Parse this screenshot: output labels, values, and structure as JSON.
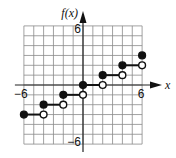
{
  "chart_data": {
    "type": "line",
    "subtype": "step-function",
    "title": "",
    "xlabel": "x",
    "ylabel": "f(x)",
    "xlim": [
      -6,
      6
    ],
    "ylim": [
      -6,
      6
    ],
    "grid": true,
    "grid_step": 1,
    "tick_labels": {
      "x_min": "−6",
      "x_max": "6",
      "y_min": "−6",
      "y_max": "6"
    },
    "segments": [
      {
        "x_start": -6,
        "x_end": -4,
        "y": -3,
        "start_closed": true,
        "end_closed": false
      },
      {
        "x_start": -4,
        "x_end": -2,
        "y": -2,
        "start_closed": true,
        "end_closed": false
      },
      {
        "x_start": -2,
        "x_end": 0,
        "y": -1,
        "start_closed": true,
        "end_closed": false
      },
      {
        "x_start": 0,
        "x_end": 2,
        "y": 0,
        "start_closed": true,
        "end_closed": false
      },
      {
        "x_start": 2,
        "x_end": 4,
        "y": 1,
        "start_closed": true,
        "end_closed": false
      },
      {
        "x_start": 4,
        "x_end": 6,
        "y": 2,
        "start_closed": true,
        "end_closed": false
      }
    ],
    "isolated_points": [
      {
        "x": 6,
        "y": 3,
        "closed": true
      }
    ]
  }
}
